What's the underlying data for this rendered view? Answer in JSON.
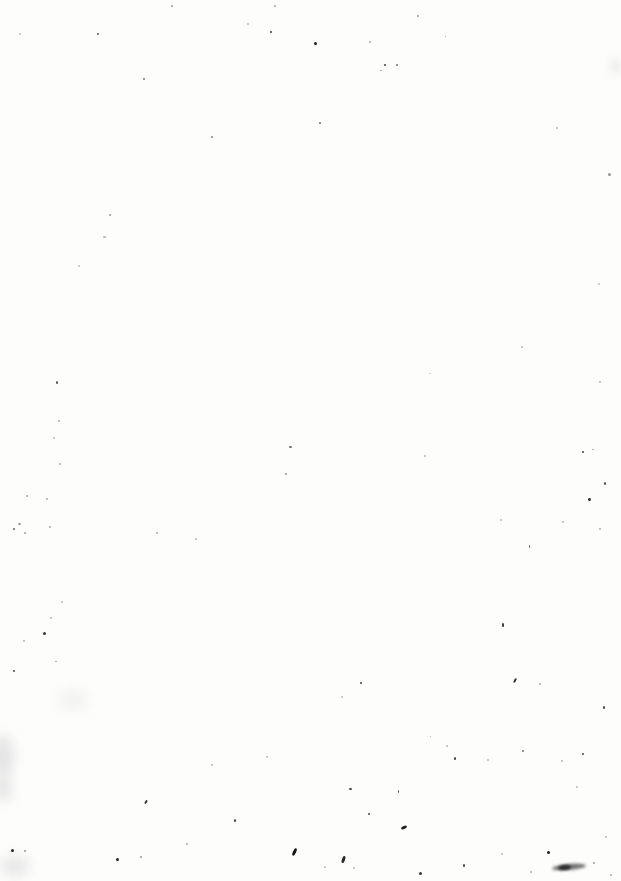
{
  "page": {
    "kind": "blank-scanned-page",
    "background_color": "#fdfdfc",
    "width": 621,
    "height": 881
  },
  "specks": [
    [
      171,
      5,
      2,
      2,
      150,
      0
    ],
    [
      274,
      5,
      2,
      2,
      170,
      0
    ],
    [
      97,
      33,
      2,
      2,
      90,
      0
    ],
    [
      270,
      31,
      2,
      2,
      60,
      0
    ],
    [
      19,
      33,
      2,
      2,
      190,
      0
    ],
    [
      247,
      23,
      2,
      2,
      180,
      0
    ],
    [
      143,
      78,
      2,
      2,
      120,
      0
    ],
    [
      211,
      136,
      2,
      2,
      130,
      0
    ],
    [
      109,
      214,
      2,
      2,
      150,
      0
    ],
    [
      314,
      42,
      3,
      3,
      30,
      0
    ],
    [
      384,
      64,
      2,
      2,
      70,
      0
    ],
    [
      396,
      64,
      2,
      2,
      110,
      0
    ],
    [
      380,
      70,
      2,
      1,
      150,
      0
    ],
    [
      319,
      122,
      2,
      2,
      100,
      0
    ],
    [
      369,
      41,
      2,
      2,
      170,
      0
    ],
    [
      417,
      15,
      2,
      2,
      160,
      0
    ],
    [
      608,
      173,
      3,
      3,
      150,
      0
    ],
    [
      556,
      127,
      2,
      2,
      180,
      0
    ],
    [
      445,
      36,
      1,
      1,
      160,
      0
    ],
    [
      103,
      236,
      3,
      2,
      180,
      0
    ],
    [
      78,
      265,
      2,
      2,
      190,
      0
    ],
    [
      56,
      381,
      2,
      3,
      80,
      0
    ],
    [
      58,
      420,
      2,
      2,
      170,
      0
    ],
    [
      53,
      437,
      2,
      2,
      180,
      0
    ],
    [
      521,
      346,
      2,
      2,
      180,
      0
    ],
    [
      598,
      283,
      2,
      2,
      190,
      0
    ],
    [
      599,
      381,
      2,
      2,
      180,
      0
    ],
    [
      429,
      373,
      2,
      1,
      190,
      0
    ],
    [
      289,
      446,
      3,
      2,
      100,
      0
    ],
    [
      285,
      473,
      2,
      2,
      150,
      0
    ],
    [
      59,
      463,
      2,
      2,
      170,
      0
    ],
    [
      26,
      495,
      2,
      2,
      160,
      0
    ],
    [
      46,
      498,
      2,
      2,
      170,
      0
    ],
    [
      18,
      523,
      3,
      2,
      150,
      0
    ],
    [
      13,
      528,
      2,
      2,
      100,
      0
    ],
    [
      24,
      532,
      2,
      2,
      160,
      0
    ],
    [
      49,
      526,
      2,
      2,
      170,
      0
    ],
    [
      156,
      532,
      2,
      2,
      170,
      0
    ],
    [
      195,
      538,
      2,
      2,
      180,
      0
    ],
    [
      43,
      632,
      3,
      3,
      60,
      0
    ],
    [
      23,
      640,
      2,
      2,
      180,
      0
    ],
    [
      61,
      601,
      2,
      2,
      185,
      0
    ],
    [
      50,
      617,
      2,
      2,
      180,
      0
    ],
    [
      582,
      451,
      2,
      2,
      60,
      0
    ],
    [
      592,
      449,
      2,
      1,
      150,
      0
    ],
    [
      604,
      482,
      2,
      3,
      70,
      0
    ],
    [
      588,
      498,
      3,
      3,
      50,
      20
    ],
    [
      529,
      545,
      1,
      3,
      80,
      0
    ],
    [
      502,
      623,
      2,
      4,
      60,
      0
    ],
    [
      599,
      528,
      2,
      2,
      170,
      0
    ],
    [
      562,
      521,
      2,
      2,
      180,
      0
    ],
    [
      500,
      519,
      2,
      2,
      185,
      0
    ],
    [
      424,
      455,
      2,
      2,
      180,
      0
    ],
    [
      13,
      670,
      2,
      2,
      70,
      0
    ],
    [
      55,
      661,
      2,
      1,
      150,
      0
    ],
    [
      145,
      800,
      2,
      4,
      50,
      30
    ],
    [
      11,
      849,
      3,
      3,
      40,
      0
    ],
    [
      24,
      850,
      2,
      2,
      150,
      0
    ],
    [
      116,
      858,
      3,
      3,
      40,
      0
    ],
    [
      140,
      856,
      2,
      2,
      150,
      0
    ],
    [
      293,
      848,
      3,
      8,
      20,
      25
    ],
    [
      186,
      843,
      2,
      2,
      170,
      0
    ],
    [
      234,
      819,
      2,
      3,
      60,
      0
    ],
    [
      211,
      764,
      2,
      2,
      180,
      0
    ],
    [
      266,
      756,
      2,
      2,
      185,
      0
    ],
    [
      360,
      682,
      2,
      2,
      60,
      0
    ],
    [
      514,
      678,
      2,
      5,
      50,
      30
    ],
    [
      539,
      683,
      2,
      2,
      170,
      0
    ],
    [
      603,
      706,
      2,
      3,
      60,
      0
    ],
    [
      454,
      757,
      2,
      3,
      60,
      0
    ],
    [
      487,
      759,
      2,
      2,
      180,
      0
    ],
    [
      522,
      750,
      2,
      2,
      110,
      0
    ],
    [
      582,
      753,
      2,
      2,
      70,
      0
    ],
    [
      561,
      760,
      2,
      2,
      180,
      0
    ],
    [
      446,
      745,
      2,
      2,
      180,
      0
    ],
    [
      349,
      788,
      3,
      2,
      60,
      0
    ],
    [
      398,
      790,
      1,
      3,
      70,
      0
    ],
    [
      368,
      813,
      2,
      2,
      70,
      0
    ],
    [
      401,
      826,
      6,
      3,
      30,
      -25
    ],
    [
      342,
      856,
      3,
      7,
      40,
      20
    ],
    [
      547,
      851,
      3,
      3,
      30,
      0
    ],
    [
      419,
      872,
      3,
      3,
      60,
      0
    ],
    [
      463,
      864,
      2,
      3,
      60,
      0
    ],
    [
      501,
      853,
      2,
      2,
      180,
      0
    ],
    [
      530,
      871,
      2,
      2,
      170,
      0
    ],
    [
      324,
      866,
      2,
      2,
      185,
      0
    ],
    [
      353,
      867,
      2,
      2,
      185,
      0
    ],
    [
      593,
      862,
      2,
      2,
      160,
      0
    ],
    [
      341,
      696,
      2,
      2,
      185,
      0
    ],
    [
      430,
      736,
      1,
      1,
      170,
      0
    ],
    [
      576,
      786,
      2,
      2,
      180,
      0
    ],
    [
      605,
      836,
      2,
      2,
      185,
      0
    ],
    [
      610,
      874,
      2,
      2,
      170,
      0
    ]
  ],
  "smudges": [
    [
      552,
      864,
      34,
      6,
      110,
      -5,
      1.5
    ],
    [
      558,
      865,
      13,
      5,
      45,
      -5,
      0.8
    ],
    [
      -8,
      735,
      22,
      42,
      228,
      0,
      6
    ],
    [
      -6,
      772,
      18,
      30,
      230,
      0,
      6
    ],
    [
      0,
      856,
      30,
      20,
      232,
      0,
      6
    ],
    [
      610,
      58,
      12,
      16,
      236,
      0,
      5
    ],
    [
      60,
      690,
      26,
      20,
      240,
      0,
      7
    ]
  ]
}
